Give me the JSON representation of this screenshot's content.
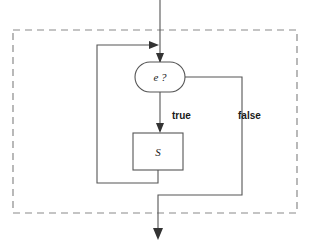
{
  "diagram": {
    "background_color": "#ffffff",
    "line_color": "#555555",
    "dashed_border_color": "#8a8a8a",
    "arrow_color": "#333333",
    "region": {
      "name": "loop-region",
      "style": "dashed",
      "x": 13,
      "y": 30,
      "width": 284,
      "height": 183
    },
    "nodes": [
      {
        "id": "condition",
        "shape": "stadium",
        "label": "e ?",
        "cx": 160,
        "cy": 77,
        "rx": 25,
        "ry": 15
      },
      {
        "id": "body",
        "shape": "rectangle",
        "label": "S",
        "x": 133,
        "y": 133,
        "width": 50,
        "height": 37
      }
    ],
    "edge_labels": [
      {
        "id": "true-label",
        "text": "true",
        "x": 172,
        "y": 116
      },
      {
        "id": "false-label",
        "text": "false",
        "x": 238,
        "y": 116
      }
    ],
    "edges": [
      {
        "id": "entry-edge",
        "from": "start",
        "to": "condition",
        "label": ""
      },
      {
        "id": "back-edge",
        "from": "body",
        "to": "condition",
        "label": ""
      },
      {
        "id": "true-edge",
        "from": "condition",
        "to": "body",
        "label": "true"
      },
      {
        "id": "false-edge",
        "from": "condition",
        "to": "exit",
        "label": "false"
      }
    ]
  }
}
